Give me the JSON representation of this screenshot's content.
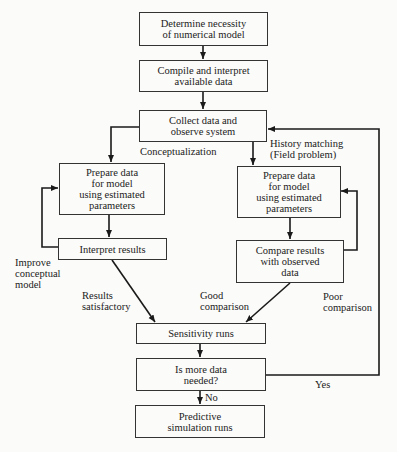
{
  "nodes": {
    "determine": "Determine necessity\nof numerical model",
    "compile": "Compile and interpret\navailable data",
    "collect": "Collect data and\nobserve system",
    "prepare_left": "Prepare data\nfor model\nusing estimated\nparameters",
    "interpret": "Interpret results",
    "prepare_right": "Prepare data\nfor model\nusing estimated\nparameters",
    "compare": "Compare results\nwith observed\ndata",
    "sensitivity": "Sensitivity runs",
    "more_data": "Is more data\nneeded?",
    "predictive": "Predictive\nsimulation runs"
  },
  "edge_labels": {
    "conceptualization": "Conceptualization",
    "history_matching": "History matching\n(Field problem)",
    "improve_model": "Improve\nconceptual\nmodel",
    "results_satisfactory": "Results\nsatisfactory",
    "good_comparison": "Good\ncomparison",
    "poor_comparison": "Poor\ncomparison",
    "yes": "Yes",
    "no": "No"
  },
  "colors": {
    "line": "#1a1a1a",
    "background": "#fbfbf9"
  }
}
